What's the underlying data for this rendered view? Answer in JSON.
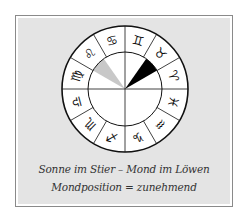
{
  "figure": {
    "caption_line1": "Sonne im Stier – Mond im Löwen",
    "caption_line2": "Mondposition = zunehmend",
    "colors": {
      "panel": "#e4e4e4",
      "sun_sector": "#000000",
      "moon_sector": "#c8c8c8",
      "lines": "#111111"
    },
    "wheel": {
      "center": [
        125,
        89
      ],
      "outer_radius": 63,
      "inner_radius": 37,
      "signs": [
        {
          "name": "aries",
          "glyph": "♈",
          "start_deg": 0
        },
        {
          "name": "taurus",
          "glyph": "♉",
          "start_deg": 30
        },
        {
          "name": "gemini",
          "glyph": "♊",
          "start_deg": 60
        },
        {
          "name": "cancer",
          "glyph": "♋",
          "start_deg": 90
        },
        {
          "name": "leo",
          "glyph": "♌",
          "start_deg": 120
        },
        {
          "name": "virgo",
          "glyph": "♍",
          "start_deg": 150
        },
        {
          "name": "libra",
          "glyph": "♎",
          "start_deg": 180
        },
        {
          "name": "scorpio",
          "glyph": "♏",
          "start_deg": 210
        },
        {
          "name": "sagittarius",
          "glyph": "♐",
          "start_deg": 240
        },
        {
          "name": "capricorn",
          "glyph": "♑",
          "start_deg": 270
        },
        {
          "name": "aquarius",
          "glyph": "♒",
          "start_deg": 300
        },
        {
          "name": "pisces",
          "glyph": "♓",
          "start_deg": 330
        }
      ],
      "sun_sector": {
        "sign": "taurus",
        "from_deg": 30,
        "to_deg": 55
      },
      "moon_sector": {
        "sign": "leo",
        "from_deg": 125,
        "to_deg": 150
      }
    }
  }
}
